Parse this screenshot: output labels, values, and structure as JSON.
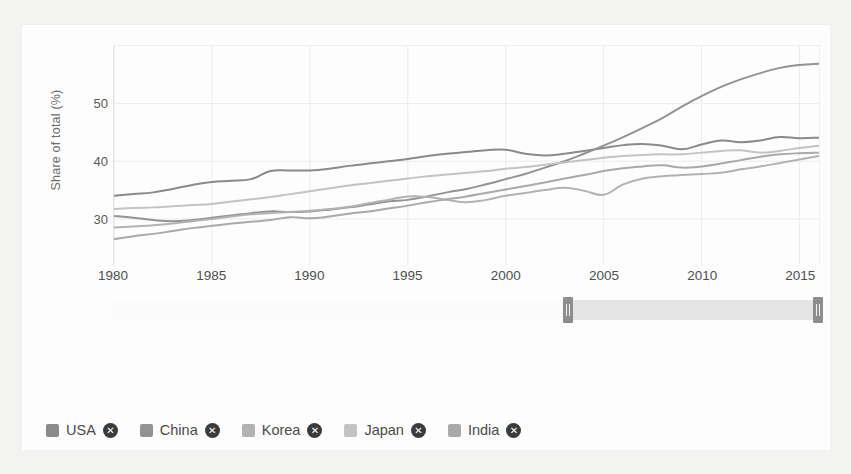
{
  "chart_data": {
    "type": "line",
    "title": "",
    "xlabel": "",
    "ylabel": "Share of total (%)",
    "xlim": [
      1980,
      2016
    ],
    "ylim": [
      22,
      60
    ],
    "grid": true,
    "legend_position": "bottom",
    "x_ticks": [
      1980,
      1985,
      1990,
      1995,
      2000,
      2005,
      2010,
      2015
    ],
    "y_ticks": [
      30,
      40,
      50
    ],
    "x": [
      1980,
      1981,
      1982,
      1983,
      1984,
      1985,
      1986,
      1987,
      1988,
      1989,
      1990,
      1991,
      1992,
      1993,
      1994,
      1995,
      1996,
      1997,
      1998,
      1999,
      2000,
      2001,
      2002,
      2003,
      2004,
      2005,
      2006,
      2007,
      2008,
      2009,
      2010,
      2011,
      2012,
      2013,
      2014,
      2015,
      2016
    ],
    "series": [
      {
        "name": "USA",
        "color": "#8a8a8a",
        "values": [
          34.0,
          34.3,
          34.6,
          35.2,
          35.9,
          36.4,
          36.6,
          36.9,
          38.3,
          38.4,
          38.4,
          38.7,
          39.2,
          39.6,
          40.0,
          40.4,
          40.9,
          41.3,
          41.6,
          41.9,
          42.0,
          41.3,
          41.0,
          41.3,
          41.8,
          42.3,
          42.8,
          43.0,
          42.7,
          42.1,
          42.9,
          43.6,
          43.3,
          43.6,
          44.2,
          44.0,
          44.1
        ]
      },
      {
        "name": "China",
        "color": "#939393",
        "values": [
          30.5,
          30.2,
          29.8,
          29.6,
          29.8,
          30.2,
          30.6,
          31.0,
          31.3,
          31.2,
          31.3,
          31.6,
          32.0,
          32.5,
          33.0,
          33.3,
          33.9,
          34.6,
          35.2,
          36.0,
          36.9,
          37.8,
          38.9,
          40.0,
          41.3,
          42.7,
          44.2,
          45.8,
          47.5,
          49.5,
          51.3,
          52.9,
          54.2,
          55.3,
          56.2,
          56.7,
          56.9
        ]
      },
      {
        "name": "Korea",
        "color": "#b2b2b2",
        "values": [
          28.5,
          28.7,
          28.9,
          29.2,
          29.6,
          30.0,
          30.4,
          30.8,
          31.0,
          31.2,
          31.4,
          31.7,
          32.1,
          32.7,
          33.3,
          33.9,
          33.8,
          33.3,
          32.9,
          33.3,
          34.0,
          34.5,
          35.0,
          35.4,
          34.9,
          34.2,
          36.0,
          37.0,
          37.4,
          37.6,
          37.8,
          38.0,
          38.6,
          39.1,
          39.7,
          40.3,
          40.9
        ]
      },
      {
        "name": "Japan",
        "color": "#c3c3c3",
        "values": [
          31.7,
          31.9,
          32.0,
          32.2,
          32.4,
          32.6,
          33.0,
          33.4,
          33.8,
          34.3,
          34.8,
          35.3,
          35.8,
          36.2,
          36.6,
          37.0,
          37.4,
          37.7,
          38.0,
          38.3,
          38.7,
          39.0,
          39.4,
          39.8,
          40.2,
          40.6,
          40.9,
          41.1,
          41.2,
          41.2,
          41.5,
          41.8,
          41.9,
          41.5,
          41.8,
          42.3,
          42.7
        ]
      },
      {
        "name": "India",
        "color": "#a9a9a9",
        "values": [
          26.5,
          27.0,
          27.4,
          27.9,
          28.4,
          28.8,
          29.2,
          29.5,
          29.8,
          30.3,
          30.1,
          30.4,
          30.9,
          31.3,
          31.8,
          32.3,
          32.9,
          33.4,
          33.9,
          34.5,
          35.1,
          35.7,
          36.3,
          37.0,
          37.6,
          38.3,
          38.8,
          39.1,
          39.3,
          38.9,
          39.1,
          39.6,
          40.2,
          40.8,
          41.2,
          41.4,
          41.5
        ]
      }
    ]
  },
  "legend": {
    "items": [
      {
        "label": "USA",
        "color": "#8a8a8a",
        "remove_glyph": "✕"
      },
      {
        "label": "China",
        "color": "#939393",
        "remove_glyph": "✕"
      },
      {
        "label": "Korea",
        "color": "#b2b2b2",
        "remove_glyph": "✕"
      },
      {
        "label": "Japan",
        "color": "#c3c3c3",
        "remove_glyph": "✕"
      },
      {
        "label": "India",
        "color": "#a9a9a9",
        "remove_glyph": "✕"
      }
    ]
  },
  "range_slider": {
    "selection_start_pct": 63.5,
    "selection_end_pct": 98.5
  }
}
